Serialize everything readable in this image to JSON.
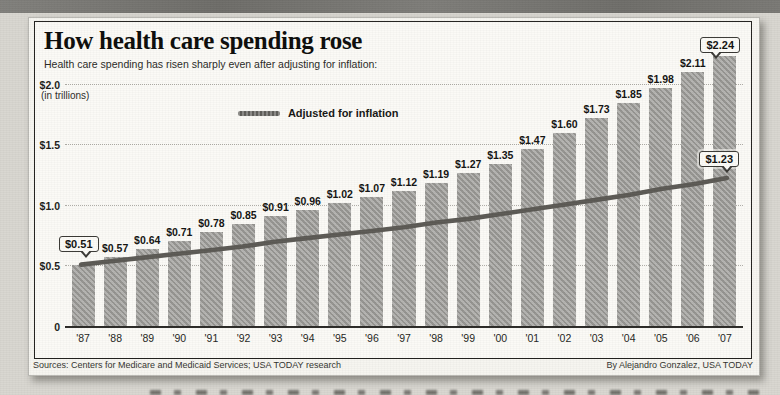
{
  "header": {
    "title": "How health care spending rose",
    "subtitle": "Health care spending has risen sharply even after adjusting for inflation:",
    "units_note": "(in trillions)"
  },
  "legend": {
    "label": "Adjusted for inflation"
  },
  "footer": {
    "sources": "Sources: Centers for Medicare and Medicaid Services; USA TODAY research",
    "credit": "By Alejandro Gonzalez, USA TODAY"
  },
  "colors": {
    "bar": "#a2a19d",
    "line": "#5c5a55",
    "frame_border": "#23221f",
    "card_background": "#fbfaf6",
    "page_background": "#d8d6d0",
    "top_strip": "#757470"
  },
  "chart_data": {
    "type": "bar",
    "title": "How health care spending rose",
    "subtitle": "Health care spending has risen sharply even after adjusting for inflation:",
    "ylabel": "(in trillions)",
    "categories": [
      "'87",
      "'88",
      "'89",
      "'90",
      "'91",
      "'92",
      "'93",
      "'94",
      "'95",
      "'96",
      "'97",
      "'98",
      "'99",
      "'00",
      "'01",
      "'02",
      "'03",
      "'04",
      "'05",
      "'06",
      "'07"
    ],
    "series": [
      {
        "name": "Health care spending",
        "type": "bar",
        "values": [
          0.51,
          0.57,
          0.64,
          0.71,
          0.78,
          0.85,
          0.91,
          0.96,
          1.02,
          1.07,
          1.12,
          1.19,
          1.27,
          1.35,
          1.47,
          1.6,
          1.73,
          1.85,
          1.98,
          2.11,
          2.24
        ],
        "labels": [
          "$0.51",
          "$0.57",
          "$0.64",
          "$0.71",
          "$0.78",
          "$0.85",
          "$0.91",
          "$0.96",
          "$1.02",
          "$1.07",
          "$1.12",
          "$1.19",
          "$1.27",
          "$1.35",
          "$1.47",
          "$1.60",
          "$1.73",
          "$1.85",
          "$1.98",
          "$2.11",
          "$2.24"
        ]
      },
      {
        "name": "Adjusted for inflation",
        "type": "line",
        "values": [
          0.51,
          0.54,
          0.57,
          0.6,
          0.63,
          0.66,
          0.7,
          0.73,
          0.76,
          0.79,
          0.82,
          0.86,
          0.89,
          0.93,
          0.97,
          1.01,
          1.05,
          1.09,
          1.14,
          1.18,
          1.23
        ]
      }
    ],
    "yticks": [
      {
        "label": "$2.0",
        "value": 2.0
      },
      {
        "label": "$1.5",
        "value": 1.5
      },
      {
        "label": "$1.0",
        "value": 1.0
      },
      {
        "label": "$0.5",
        "value": 0.5
      },
      {
        "label": "0",
        "value": 0
      }
    ],
    "ylim": [
      0,
      2.285
    ],
    "grid": "dotted-horizontal",
    "legend_position": "inside-upper-left-center",
    "callouts": [
      {
        "text": "$0.51",
        "target": "line-start-87"
      },
      {
        "text": "$2.24",
        "target": "bar-07"
      },
      {
        "text": "$1.23",
        "target": "line-end-07"
      }
    ]
  }
}
